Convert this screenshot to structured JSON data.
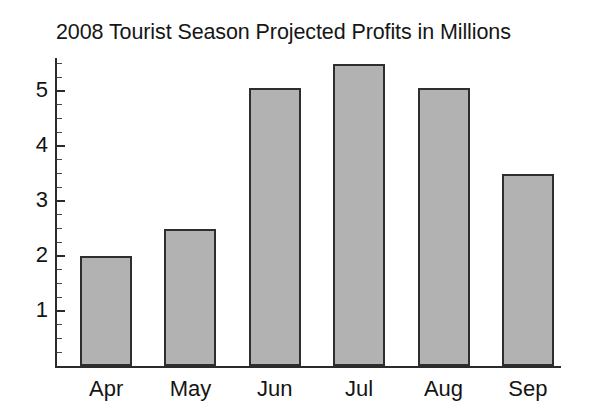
{
  "chart_data": {
    "type": "bar",
    "title": "2008 Tourist Season Projected Profits in Millions",
    "xlabel": "",
    "ylabel": "",
    "categories": [
      "Apr",
      "May",
      "Jun",
      "Jul",
      "Aug",
      "Sep"
    ],
    "values": [
      2.0,
      2.5,
      5.05,
      5.5,
      5.05,
      3.5
    ],
    "ylim": [
      0,
      5.8
    ],
    "ytick_labels": [
      "1",
      "2",
      "3",
      "4",
      "5"
    ],
    "ytick_values": [
      1,
      2,
      3,
      4,
      5
    ],
    "minor_ticks": true,
    "minor_tick_interval": 0.25,
    "grid": false,
    "legend": false,
    "bar_color": "#b2b2b2",
    "bar_border_color": "#2e2e2e",
    "axis_color": "#2b2b2b",
    "background_color": "#ffffff"
  }
}
